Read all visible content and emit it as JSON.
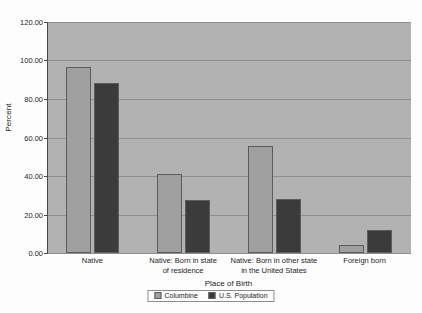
{
  "chart_data": {
    "type": "bar",
    "title": "",
    "xlabel": "Place of Birth",
    "ylabel": "Percent",
    "ylim": [
      0,
      120
    ],
    "ytick_step": 20,
    "ytick_labels": [
      "0.00",
      "20.00",
      "40.00",
      "60.00",
      "80.00",
      "100.00",
      "120.00"
    ],
    "ytick_values": [
      0,
      20,
      40,
      60,
      80,
      100,
      120
    ],
    "grid": true,
    "legend_position": "bottom",
    "categories": [
      "Native",
      "Native: Born in state of residence",
      "Native: Born in other state in the United States",
      "Foreign born"
    ],
    "category_lines": [
      [
        "Native"
      ],
      [
        "Native: Born in state",
        "of residence"
      ],
      [
        "Native: Born in other state",
        "in the United States"
      ],
      [
        "Foreign born"
      ]
    ],
    "series": [
      {
        "name": "Columbine",
        "color": "#a0a0a0",
        "values": [
          96.5,
          41.0,
          55.5,
          4.0
        ]
      },
      {
        "name": "U.S. Population",
        "color": "#3b3b3b",
        "values": [
          88.5,
          27.8,
          28.0,
          12.0
        ]
      }
    ],
    "colors": {
      "plot_background": "#b2b2b2",
      "gridline": "#8f8f8f",
      "axis": "#4a4a4a",
      "page_background": "#fdfdfd",
      "text": "#1d1d1d"
    }
  }
}
